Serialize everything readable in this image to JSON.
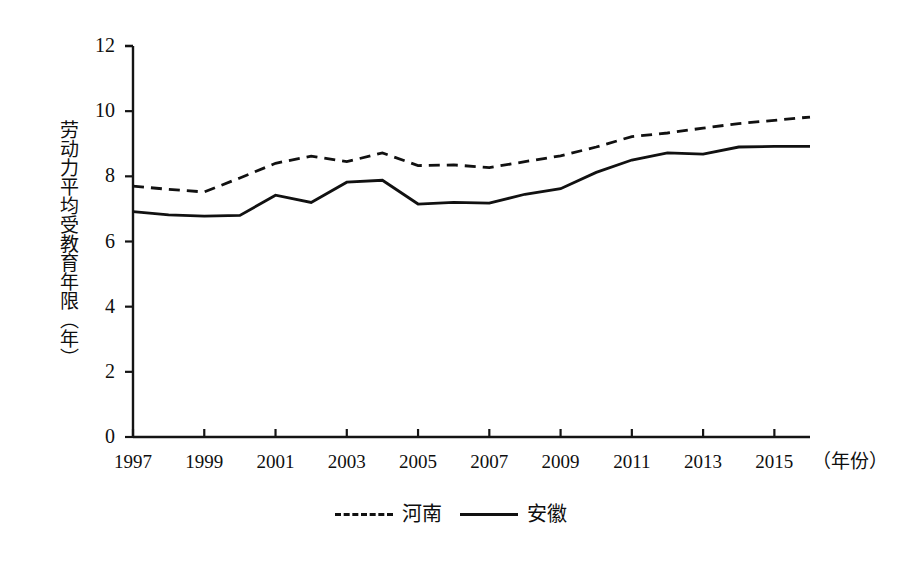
{
  "chart_data": {
    "type": "line",
    "title": "",
    "xlabel": "（年份）",
    "ylabel": "劳动力平均受教育年限（年）",
    "x": [
      1997,
      1998,
      1999,
      2000,
      2001,
      2002,
      2003,
      2004,
      2005,
      2006,
      2007,
      2008,
      2009,
      2010,
      2011,
      2012,
      2013,
      2014,
      2015,
      2016
    ],
    "xlim": [
      1997,
      2016
    ],
    "ylim": [
      0,
      12
    ],
    "yticks": [
      0,
      2,
      4,
      6,
      8,
      10,
      12
    ],
    "xticks": [
      1997,
      1999,
      2001,
      2003,
      2005,
      2007,
      2009,
      2011,
      2013,
      2015
    ],
    "grid": false,
    "legend_position": "bottom-center",
    "series": [
      {
        "name": "河南",
        "style": "dashed",
        "color": "#111111",
        "values": [
          7.7,
          7.6,
          7.52,
          7.95,
          8.4,
          8.62,
          8.45,
          8.72,
          8.33,
          8.35,
          8.27,
          8.45,
          8.63,
          8.9,
          9.22,
          9.33,
          9.48,
          9.62,
          9.72,
          9.82
        ]
      },
      {
        "name": "安徽",
        "style": "solid",
        "color": "#111111",
        "values": [
          6.92,
          6.82,
          6.78,
          6.8,
          7.42,
          7.2,
          7.82,
          7.88,
          7.15,
          7.2,
          7.18,
          7.45,
          7.62,
          8.12,
          8.5,
          8.72,
          8.68,
          8.9,
          8.92,
          8.92
        ]
      }
    ]
  },
  "axes": {
    "y_tick_labels": [
      "12",
      "10",
      "8",
      "6",
      "4",
      "2",
      "0"
    ],
    "x_tick_labels": [
      "1997",
      "1999",
      "2001",
      "2003",
      "2005",
      "2007",
      "2009",
      "2011",
      "2013",
      "2015"
    ],
    "x_unit_label": "（年份）",
    "y_title": "劳动力平均受教育年限（年）"
  },
  "legend": {
    "entries": [
      {
        "label": "河南",
        "style": "dashed"
      },
      {
        "label": "安徽",
        "style": "solid"
      }
    ]
  },
  "colors": {
    "line": "#111111",
    "axis": "#141414",
    "background": "#ffffff"
  }
}
